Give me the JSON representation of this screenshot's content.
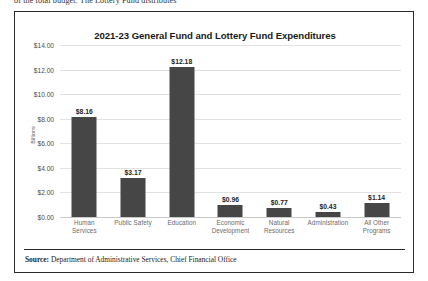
{
  "page": {
    "clipped_text_above": "of the total budget. The Lottery Fund distributes"
  },
  "figure": {
    "title": "2021-23 General Fund and Lottery Fund Expenditures",
    "y_axis_caption": "Billions",
    "source_label": "Source:",
    "source_text": "Department of Administrative Services, Chief Financial Office",
    "bar_color": "#464646",
    "gridline_color": "#e2e2e2",
    "border_color": "#2a2a2a"
  },
  "chart_data": {
    "type": "bar",
    "title": "2021-23 General Fund and Lottery Fund Expenditures",
    "xlabel": "",
    "ylabel": "Billions",
    "ylim": [
      0,
      14
    ],
    "ytick_step": 2,
    "ytick_labels": [
      "$0.00",
      "$2.00",
      "$4.00",
      "$6.00",
      "$8.00",
      "$10.00",
      "$12.00",
      "$14.00"
    ],
    "ytick_values": [
      0,
      2,
      4,
      6,
      8,
      10,
      12,
      14
    ],
    "grid": true,
    "legend": false,
    "categories": [
      "Human Services",
      "Public Safety",
      "Education",
      "Economic Development",
      "Natural Resources",
      "Administration",
      "All Other Programs"
    ],
    "category_lines": [
      [
        "Human",
        "Services"
      ],
      [
        "Public Safety"
      ],
      [
        "Education"
      ],
      [
        "Economic",
        "Development"
      ],
      [
        "Natural",
        "Resources"
      ],
      [
        "Administration"
      ],
      [
        "All Other",
        "Programs"
      ]
    ],
    "values": [
      8.16,
      3.17,
      12.18,
      0.96,
      0.77,
      0.43,
      1.14
    ],
    "data_labels": [
      "$8.16",
      "$3.17",
      "$12.18",
      "$0.96",
      "$0.77",
      "$0.43",
      "$1.14"
    ]
  }
}
